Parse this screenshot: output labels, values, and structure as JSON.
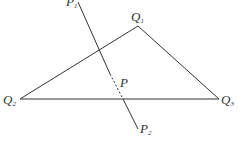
{
  "diagram": {
    "type": "geometry",
    "colors": {
      "stroke": "#333333",
      "background": "#ffffff"
    },
    "points": {
      "Q1": {
        "label": "Q",
        "sub": "1",
        "x": 138,
        "y": 26
      },
      "Q2": {
        "label": "Q",
        "sub": "2",
        "x": 20,
        "y": 99
      },
      "Q3": {
        "label": "Q",
        "sub": "3",
        "x": 219,
        "y": 99
      },
      "P1": {
        "label": "P",
        "sub": "1",
        "x": 78,
        "y": 0
      },
      "P2": {
        "label": "P",
        "sub": "2",
        "x": 138,
        "y": 130
      },
      "P": {
        "label": "P"
      }
    },
    "edges": [
      {
        "from": "Q1",
        "to": "Q2",
        "style": "solid"
      },
      {
        "from": "Q1",
        "to": "Q3",
        "style": "solid"
      },
      {
        "from": "Q2",
        "to": "Q3",
        "style": "solid"
      },
      {
        "from": "P1",
        "to": "P2",
        "style": "solid-with-dashed-segment",
        "dashed_between": "P"
      }
    ]
  }
}
